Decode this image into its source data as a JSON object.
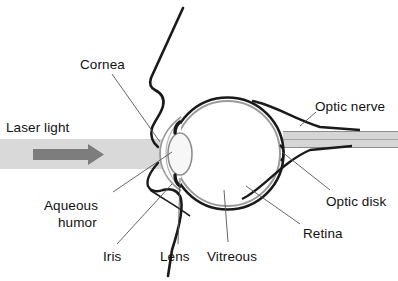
{
  "figure": {
    "type": "anatomical-diagram",
    "width": 398,
    "height": 281,
    "background_color": "#ffffff",
    "ink_color": "#111111"
  },
  "labels": {
    "cornea": "Cornea",
    "laser_light": "Laser light",
    "aqueous_humor": "Aqueous\nhumor",
    "aqueous_humor_line1": "Aqueous",
    "aqueous_humor_line2": "humor",
    "iris": "Iris",
    "lens": "Lens",
    "vitreous": "Vitreous",
    "retina": "Retina",
    "optic_disk": "Optic disk",
    "optic_nerve": "Optic nerve"
  },
  "colors": {
    "outline": "#1a1a1a",
    "inner_membrane": "#9a9a9a",
    "beam_band": "#d9d9d9",
    "beam_cone": "#cfcfcf",
    "arrow": "#7d7d7d",
    "nerve_band": "#d5d5d5",
    "leader_line": "#555555",
    "lens_fill": "#f7f7f7",
    "text": "#111111"
  },
  "structures": [
    {
      "name": "cornea",
      "description": "anterior transparent dome at front of eye"
    },
    {
      "name": "aqueous-humor",
      "description": "fluid chamber between cornea and lens"
    },
    {
      "name": "iris",
      "description": "pigmented diaphragm around the pupil"
    },
    {
      "name": "lens",
      "description": "biconvex focusing element"
    },
    {
      "name": "vitreous",
      "description": "gel filling the posterior chamber"
    },
    {
      "name": "retina",
      "description": "inner light-sensitive membrane lining the globe"
    },
    {
      "name": "optic-disk",
      "description": "point where optic nerve leaves the retina"
    },
    {
      "name": "optic-nerve",
      "description": "nerve bundle exiting posteriorly to the right"
    },
    {
      "name": "laser-beam",
      "description": "horizontal gray beam entering from the left, converging inside the eye"
    }
  ],
  "label_positions": {
    "cornea": {
      "x": 80,
      "y": 57
    },
    "laser_light": {
      "x": 6,
      "y": 120
    },
    "aqueous_humor": {
      "x": 44,
      "y": 198
    },
    "iris": {
      "x": 103,
      "y": 249
    },
    "lens": {
      "x": 160,
      "y": 249
    },
    "vitreous": {
      "x": 207,
      "y": 249
    },
    "retina": {
      "x": 303,
      "y": 226
    },
    "optic_disk": {
      "x": 326,
      "y": 194
    },
    "optic_nerve": {
      "x": 315,
      "y": 99
    }
  }
}
